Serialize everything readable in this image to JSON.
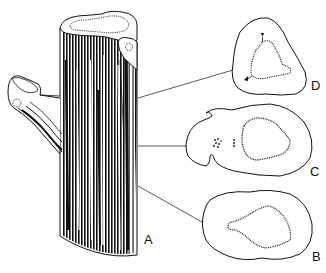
{
  "figure": {
    "type": "botanical-line-drawing",
    "colors": {
      "ink": "#111111",
      "background": "#ffffff"
    },
    "labels": {
      "a": "A",
      "b": "B",
      "c": "C",
      "d": "D"
    },
    "parts": [
      {
        "id": "A",
        "name": "stem-with-branch"
      },
      {
        "id": "B",
        "name": "cross-section-lower"
      },
      {
        "id": "C",
        "name": "cross-section-middle"
      },
      {
        "id": "D",
        "name": "cross-section-upper"
      }
    ]
  }
}
